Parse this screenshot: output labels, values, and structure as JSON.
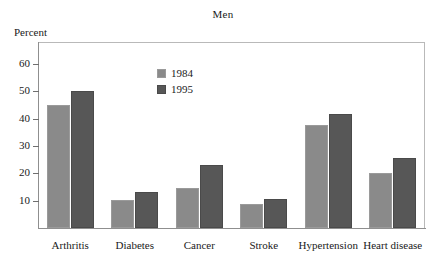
{
  "chart_data": {
    "type": "bar",
    "title": "Men",
    "xlabel": "",
    "ylabel": "Percent",
    "ylim": [
      0,
      68
    ],
    "grid": false,
    "legend_position": "inside-top-center",
    "yticks": [
      10,
      20,
      30,
      40,
      50,
      60
    ],
    "ytick_labels": [
      "10",
      "20",
      "30",
      "40",
      "50",
      "60"
    ],
    "categories": [
      "Arthritis",
      "Diabetes",
      "Cancer",
      "Stroke",
      "Hypertension",
      "Heart disease"
    ],
    "series": [
      {
        "name": "1984",
        "color": "#8a8a8a",
        "values": [
          45,
          10.3,
          14.5,
          8.6,
          37.6,
          20
        ]
      },
      {
        "name": "1995",
        "color": "#575757",
        "values": [
          50,
          13.3,
          23.2,
          10.6,
          41.5,
          25.6
        ]
      }
    ]
  },
  "chart": {
    "title": "Men",
    "axis_caption": "Percent"
  },
  "legend": {
    "items": [
      {
        "label": "1984",
        "series_key": "1984"
      },
      {
        "label": "1995",
        "series_key": "1995"
      }
    ]
  }
}
